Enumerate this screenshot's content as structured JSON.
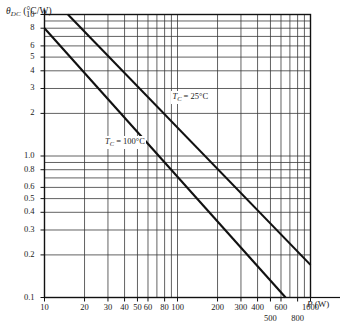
{
  "chart_data": {
    "type": "line",
    "title": "",
    "xlabel": "P (W)",
    "ylabel": "θDC (°C/W)",
    "xscale": "log",
    "yscale": "log",
    "xlim": [
      10,
      1000
    ],
    "ylim": [
      0.1,
      10
    ],
    "grid": true,
    "legend": "inline-annotations",
    "x_ticks": [
      {
        "value": 10,
        "label": "10",
        "row": 1
      },
      {
        "value": 20,
        "label": "20",
        "row": 1
      },
      {
        "value": 30,
        "label": "30",
        "row": 1
      },
      {
        "value": 40,
        "label": "40",
        "row": 1
      },
      {
        "value": 50,
        "label": "50",
        "row": 1
      },
      {
        "value": 60,
        "label": "60",
        "row": 1
      },
      {
        "value": 80,
        "label": "80",
        "row": 1
      },
      {
        "value": 100,
        "label": "100",
        "row": 1
      },
      {
        "value": 200,
        "label": "200",
        "row": 1
      },
      {
        "value": 300,
        "label": "300",
        "row": 1
      },
      {
        "value": 400,
        "label": "400",
        "row": 1
      },
      {
        "value": 500,
        "label": "500",
        "row": 2
      },
      {
        "value": 600,
        "label": "600",
        "row": 1
      },
      {
        "value": 800,
        "label": "800",
        "row": 2
      },
      {
        "value": 1000,
        "label": "1000",
        "row": 1
      }
    ],
    "x_gridlines": [
      10,
      20,
      30,
      40,
      50,
      60,
      70,
      80,
      90,
      100,
      200,
      300,
      400,
      500,
      600,
      700,
      800,
      900,
      1000
    ],
    "y_ticks": [
      {
        "value": 10,
        "label": "10"
      },
      {
        "value": 8,
        "label": "8"
      },
      {
        "value": 6,
        "label": "6"
      },
      {
        "value": 5,
        "label": "5"
      },
      {
        "value": 4,
        "label": "4"
      },
      {
        "value": 3,
        "label": "3"
      },
      {
        "value": 2,
        "label": "2"
      },
      {
        "value": 1,
        "label": "1.0"
      },
      {
        "value": 0.8,
        "label": "0.8"
      },
      {
        "value": 0.6,
        "label": "0.6"
      },
      {
        "value": 0.5,
        "label": "0.5"
      },
      {
        "value": 0.4,
        "label": "0.4"
      },
      {
        "value": 0.3,
        "label": "0.3"
      },
      {
        "value": 0.2,
        "label": "0.2"
      },
      {
        "value": 0.1,
        "label": "0.1"
      }
    ],
    "y_gridlines": [
      10,
      9,
      8,
      7,
      6,
      5,
      4,
      3,
      2,
      1,
      0.9,
      0.8,
      0.7,
      0.6,
      0.5,
      0.4,
      0.3,
      0.2,
      0.1
    ],
    "series": [
      {
        "name": "TC = 25°C",
        "label_prefix": "T",
        "label_sub": "C",
        "label_suffix": " = 25°C",
        "points": [
          [
            15,
            10.0
          ],
          [
            1000,
            0.17
          ]
        ],
        "color": "#111111",
        "label_x_value": 90,
        "label_y_value": 2.6
      },
      {
        "name": "TC = 100°C",
        "label_prefix": "T",
        "label_sub": "C",
        "label_suffix": " = 100°C",
        "points": [
          [
            10,
            8.0
          ],
          [
            650,
            0.1
          ]
        ],
        "color": "#111111",
        "label_x_value": 28,
        "label_y_value": 1.25
      }
    ]
  },
  "axis": {
    "y_title_main": "θ",
    "y_title_sub": "DC",
    "y_title_unit": "(°C/W)",
    "x_title_var": "P",
    "x_title_unit": "(W)"
  }
}
